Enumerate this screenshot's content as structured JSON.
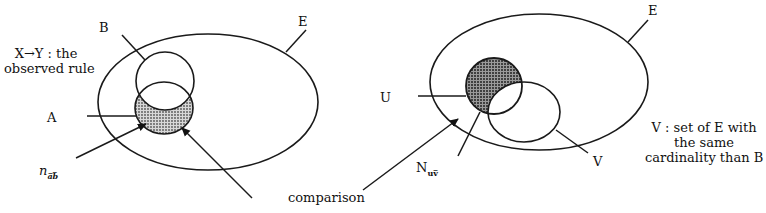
{
  "figure": {
    "left_diagram": {
      "universe_label": "E",
      "set_b_label": "B",
      "set_a_label": "A",
      "rule_caption_line1": "X→Y : the",
      "rule_caption_line2": "observed rule",
      "count_label_main": "n",
      "count_label_sub": "a̅b̅"
    },
    "right_diagram": {
      "universe_label": "E",
      "set_u_label": "U",
      "set_v_label": "V",
      "count_label_main": "N",
      "count_label_sub": "uv̅",
      "v_caption_line1": "V : set of E with",
      "v_caption_line2": "the same",
      "v_caption_line3": "cardinality than B"
    },
    "comparison_label": "comparison",
    "colors": {
      "stroke": "#1a1a1a",
      "shade_left": "#b8b8b8",
      "shade_right": "#6e6e6e"
    }
  }
}
